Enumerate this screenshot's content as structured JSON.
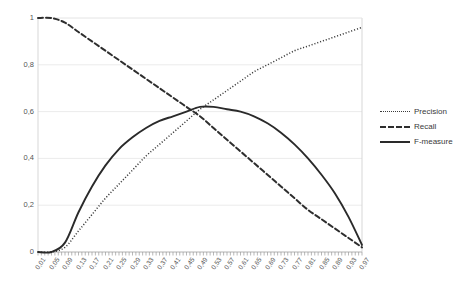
{
  "chart_data": {
    "type": "line",
    "title": "",
    "subtitle": "",
    "xlabel": "",
    "ylabel": "",
    "xlim": [
      0.01,
      0.97
    ],
    "ylim": [
      0,
      1
    ],
    "grid": true,
    "legend_position": "right",
    "decimal_separator": ",",
    "y_ticks": [
      0,
      0.2,
      0.4,
      0.6,
      0.8,
      1
    ],
    "y_tick_labels": [
      "0",
      "0,2",
      "0,4",
      "0,6",
      "0,8",
      "1"
    ],
    "x": [
      0.01,
      0.05,
      0.09,
      0.13,
      0.17,
      0.21,
      0.25,
      0.29,
      0.33,
      0.37,
      0.41,
      0.45,
      0.49,
      0.53,
      0.57,
      0.61,
      0.65,
      0.69,
      0.73,
      0.77,
      0.81,
      0.85,
      0.89,
      0.93,
      0.97
    ],
    "x_tick_labels": [
      "0,01",
      "0,05",
      "0,09",
      "0,13",
      "0,17",
      "0,21",
      "0,25",
      "0,29",
      "0,33",
      "0,37",
      "0,41",
      "0,45",
      "0,49",
      "0,53",
      "0,57",
      "0,61",
      "0,65",
      "0,69",
      "0,73",
      "0,77",
      "0,81",
      "0,85",
      "0,89",
      "0,93",
      "0,97"
    ],
    "series": [
      {
        "name": "Precision",
        "style": "dotted",
        "color": "#3a3a3a",
        "values": [
          0.0,
          0.0,
          0.02,
          0.09,
          0.16,
          0.23,
          0.29,
          0.35,
          0.41,
          0.46,
          0.51,
          0.56,
          0.61,
          0.65,
          0.69,
          0.73,
          0.77,
          0.8,
          0.83,
          0.86,
          0.88,
          0.9,
          0.92,
          0.94,
          0.96
        ]
      },
      {
        "name": "Recall",
        "style": "dashed",
        "color": "#2e2e2e",
        "values": [
          1.0,
          1.0,
          0.98,
          0.94,
          0.9,
          0.86,
          0.82,
          0.78,
          0.74,
          0.7,
          0.66,
          0.62,
          0.58,
          0.53,
          0.48,
          0.43,
          0.38,
          0.33,
          0.28,
          0.23,
          0.18,
          0.14,
          0.1,
          0.06,
          0.02
        ]
      },
      {
        "name": "F-measure",
        "style": "solid",
        "color": "#2a2a2a",
        "values": [
          0.0,
          0.0,
          0.04,
          0.17,
          0.28,
          0.37,
          0.44,
          0.49,
          0.53,
          0.56,
          0.58,
          0.6,
          0.62,
          0.62,
          0.61,
          0.6,
          0.58,
          0.55,
          0.51,
          0.46,
          0.4,
          0.33,
          0.25,
          0.15,
          0.03
        ]
      }
    ]
  },
  "legend": {
    "entries": [
      {
        "label": "Precision"
      },
      {
        "label": "Recall"
      },
      {
        "label": "F-measure"
      }
    ]
  }
}
